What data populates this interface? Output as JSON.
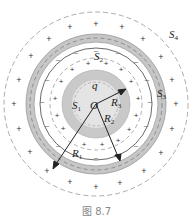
{
  "figure": {
    "caption": "图 8.7",
    "center_label": "O",
    "charge_label": "q",
    "surfaces": [
      {
        "name": "S",
        "sub": "1"
      },
      {
        "name": "S",
        "sub": "2"
      },
      {
        "name": "S",
        "sub": "3"
      },
      {
        "name": "S",
        "sub": "4"
      }
    ],
    "radii": [
      {
        "name": "R",
        "sub": "1"
      },
      {
        "name": "R",
        "sub": "2"
      },
      {
        "name": "R",
        "sub": "3"
      }
    ],
    "charge_signs": {
      "positive": "+",
      "negative": "–"
    },
    "colors": {
      "shell_gray": "#c8c8c8",
      "inner_fill": "#e2e2e2",
      "line": "#333333",
      "dash": "#777777"
    }
  }
}
